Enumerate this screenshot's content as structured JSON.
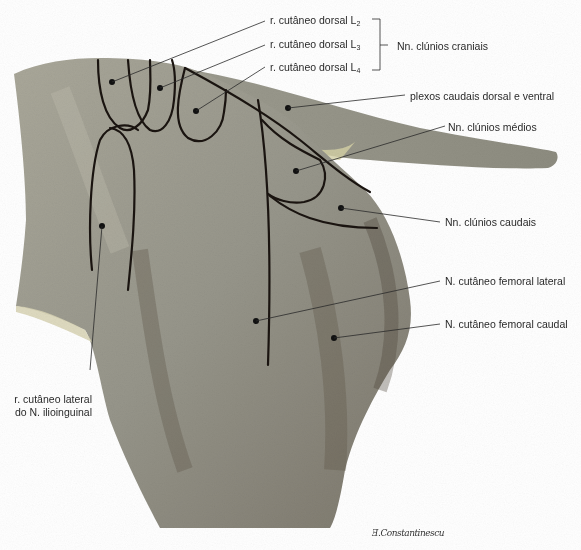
{
  "figure": {
    "colors": {
      "skin_base": "#9a9888",
      "skin_light": "#b4b2a4",
      "skin_shadow": "#5e5648",
      "tail_highlight": "#d6d2a6",
      "nerve_line": "#1a1410",
      "leader_line": "#2a2a2a",
      "label_text": "#2a2a2a"
    }
  },
  "labels": {
    "dorsal_l2": {
      "text": "r. cutâneo dorsal L",
      "sub": "2"
    },
    "dorsal_l3": {
      "text": "r. cutâneo dorsal L",
      "sub": "3"
    },
    "dorsal_l4": {
      "text": "r. cutâneo dorsal L",
      "sub": "4"
    },
    "bracket_group": "Nn. clúnios craniais",
    "plexos": "plexos caudais dorsal e ventral",
    "clunios_medios": "Nn. clúnios médios",
    "clunios_caudais": "Nn. clúnios caudais",
    "femoral_lateral": "N. cutâneo femoral lateral",
    "femoral_caudal": "N. cutâneo femoral caudal",
    "ilioinguinal": "r. cutâneo lateral do N. ilioinguinal"
  },
  "signature": "Ǝ.Constantinescu"
}
